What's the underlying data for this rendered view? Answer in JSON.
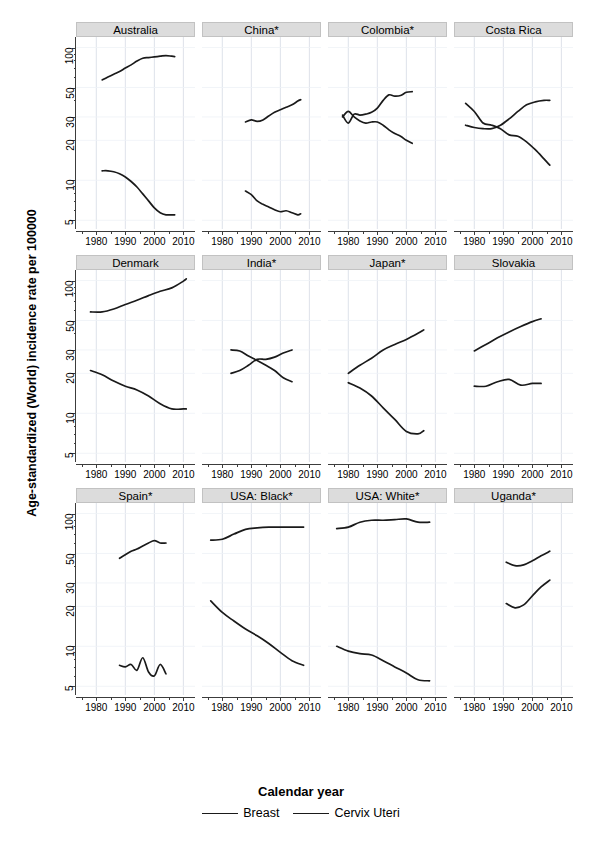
{
  "chart_data": {
    "type": "line",
    "title": "",
    "xlabel": "Calendar year",
    "ylabel": "Age-standardized (World) incidence rate per 100000",
    "yscale": "log",
    "ylim": [
      4.3,
      120
    ],
    "xlim": [
      1973,
      2014
    ],
    "yticks": [
      5,
      10,
      20,
      30,
      50,
      100
    ],
    "ytick_labels": [
      "5",
      "10",
      "20",
      "30",
      "50",
      "100"
    ],
    "xticks": [
      1980,
      1990,
      2000,
      2010
    ],
    "xtick_labels": [
      "1980",
      "1990",
      "2000",
      "2010"
    ],
    "grid": true,
    "legend": {
      "position": "bottom",
      "entries": [
        {
          "name": "Breast",
          "color": "#1a1a1a"
        },
        {
          "name": "Cervix Uteri",
          "color": "#1a1a1a"
        }
      ]
    },
    "layout": {
      "rows": 3,
      "cols": 4
    },
    "panels": [
      {
        "title": "Australia",
        "series": [
          {
            "name": "Breast",
            "x": [
              1982,
              1984,
              1986,
              1988,
              1990,
              1992,
              1994,
              1996,
              1998,
              2000,
              2002,
              2004,
              2006,
              2007
            ],
            "values": [
              57,
              60,
              63,
              66,
              70,
              74,
              79,
              83,
              84,
              85,
              86,
              87,
              86,
              85.5
            ]
          },
          {
            "name": "Cervix Uteri",
            "x": [
              1982,
              1984,
              1986,
              1988,
              1990,
              1992,
              1994,
              1996,
              1998,
              2000,
              2002,
              2004,
              2006,
              2007
            ],
            "values": [
              11.8,
              11.8,
              11.6,
              11.2,
              10.6,
              9.8,
              8.9,
              7.9,
              7.0,
              6.2,
              5.7,
              5.5,
              5.5,
              5.5
            ]
          }
        ]
      },
      {
        "title": "China*",
        "series": [
          {
            "name": "Breast",
            "x": [
              1988,
              1990,
              1992,
              1994,
              1996,
              1998,
              2000,
              2002,
              2004,
              2006,
              2007
            ],
            "values": [
              27.5,
              28.5,
              27.8,
              28.5,
              30.5,
              32.5,
              34,
              35.5,
              37,
              39.5,
              40.5
            ]
          },
          {
            "name": "Cervix Uteri",
            "x": [
              1988,
              1990,
              1992,
              1994,
              1996,
              1998,
              2000,
              2002,
              2004,
              2006,
              2007
            ],
            "values": [
              8.3,
              7.8,
              7.0,
              6.6,
              6.3,
              6.0,
              5.8,
              5.9,
              5.7,
              5.5,
              5.6
            ]
          }
        ]
      },
      {
        "title": "Colombia*",
        "series": [
          {
            "name": "Breast",
            "x": [
              1978,
              1980,
              1982,
              1984,
              1986,
              1988,
              1990,
              1992,
              1994,
              1996,
              1998,
              2000,
              2002
            ],
            "values": [
              31,
              27,
              31.5,
              31,
              31.5,
              32.5,
              35,
              40,
              44,
              43,
              43.5,
              46,
              46.5
            ]
          },
          {
            "name": "Cervix Uteri",
            "x": [
              1978,
              1980,
              1982,
              1984,
              1986,
              1988,
              1990,
              1992,
              1994,
              1996,
              1998,
              2000,
              2002
            ],
            "values": [
              30,
              33,
              30,
              28,
              27,
              27.5,
              27.5,
              26,
              24,
              22.5,
              21.5,
              20,
              19
            ]
          }
        ]
      },
      {
        "title": "Costa Rica",
        "series": [
          {
            "name": "Breast",
            "x": [
              1977,
              1980,
              1983,
              1986,
              1989,
              1992,
              1995,
              1998,
              2001,
              2004,
              2006
            ],
            "values": [
              26,
              25,
              24.5,
              24.5,
              26,
              29,
              33,
              37,
              39,
              40,
              40
            ]
          },
          {
            "name": "Cervix Uteri",
            "x": [
              1977,
              1980,
              1983,
              1986,
              1989,
              1992,
              1995,
              1998,
              2001,
              2004,
              2006
            ],
            "values": [
              38,
              33,
              27,
              26,
              24.5,
              22,
              21.5,
              19.5,
              17,
              14.5,
              13
            ]
          }
        ]
      },
      {
        "title": "Denmark",
        "series": [
          {
            "name": "Breast",
            "x": [
              1978,
              1982,
              1986,
              1990,
              1994,
              1998,
              2002,
              2006,
              2010,
              2011
            ],
            "values": [
              58,
              58,
              61,
              66,
              71,
              77,
              83,
              88,
              99,
              103
            ]
          },
          {
            "name": "Cervix Uteri",
            "x": [
              1978,
              1982,
              1986,
              1990,
              1994,
              1998,
              2002,
              2006,
              2010,
              2011
            ],
            "values": [
              21,
              19.5,
              17.5,
              16,
              15,
              13.5,
              11.8,
              10.8,
              10.8,
              10.8
            ]
          }
        ]
      },
      {
        "title": "India*",
        "series": [
          {
            "name": "Breast",
            "x": [
              1983,
              1986,
              1989,
              1992,
              1995,
              1998,
              2001,
              2004
            ],
            "values": [
              20,
              21,
              23,
              25.5,
              25.5,
              26.5,
              28.5,
              30
            ]
          },
          {
            "name": "Cervix Uteri",
            "x": [
              1983,
              1986,
              1989,
              1992,
              1995,
              1998,
              2001,
              2004
            ],
            "values": [
              30,
              29.5,
              27,
              25,
              23,
              21,
              18.5,
              17.3
            ]
          }
        ]
      },
      {
        "title": "Japan*",
        "series": [
          {
            "name": "Breast",
            "x": [
              1980,
              1984,
              1988,
              1992,
              1996,
              2000,
              2004,
              2006
            ],
            "values": [
              20,
              23,
              26,
              30,
              33,
              36,
              40,
              42.5
            ]
          },
          {
            "name": "Cervix Uteri",
            "x": [
              1980,
              1984,
              1988,
              1992,
              1996,
              2000,
              2004,
              2006
            ],
            "values": [
              17,
              15.5,
              13.5,
              11,
              9,
              7.3,
              7.0,
              7.4
            ]
          }
        ]
      },
      {
        "title": "Slovakia",
        "series": [
          {
            "name": "Breast",
            "x": [
              1980,
              1984,
              1988,
              1992,
              1996,
              2000,
              2003
            ],
            "values": [
              29.5,
              33,
              37,
              41,
              45,
              49,
              51.5
            ]
          },
          {
            "name": "Cervix Uteri",
            "x": [
              1980,
              1984,
              1988,
              1992,
              1996,
              2000,
              2003
            ],
            "values": [
              16,
              16,
              17.3,
              18,
              16.3,
              16.8,
              16.8
            ]
          }
        ]
      },
      {
        "title": "Spain*",
        "series": [
          {
            "name": "Breast",
            "x": [
              1988,
              1990,
              1992,
              1994,
              1996,
              1998,
              2000,
              2002,
              2004
            ],
            "values": [
              46,
              49,
              52,
              54,
              57,
              60,
              62.5,
              60,
              60
            ]
          },
          {
            "name": "Cervix Uteri",
            "x": [
              1988,
              1990,
              1992,
              1994,
              1996,
              1998,
              2000,
              2002,
              2004
            ],
            "values": [
              7.2,
              7.0,
              7.3,
              6.6,
              8.2,
              6.4,
              6.0,
              7.3,
              6.2
            ]
          }
        ]
      },
      {
        "title": "USA: Black*",
        "series": [
          {
            "name": "Breast",
            "x": [
              1976,
              1980,
              1984,
              1988,
              1992,
              1996,
              2000,
              2004,
              2008
            ],
            "values": [
              63,
              64,
              70,
              76,
              78,
              79,
              79,
              79,
              79
            ]
          },
          {
            "name": "Cervix Uteri",
            "x": [
              1976,
              1980,
              1984,
              1988,
              1992,
              1996,
              2000,
              2004,
              2008
            ],
            "values": [
              22,
              18,
              15.5,
              13.5,
              12,
              10.5,
              9,
              7.8,
              7.2
            ]
          }
        ]
      },
      {
        "title": "USA: White*",
        "series": [
          {
            "name": "Breast",
            "x": [
              1976,
              1980,
              1984,
              1988,
              1992,
              1996,
              2000,
              2004,
              2008
            ],
            "values": [
              77,
              79,
              86,
              89,
              89,
              90,
              91,
              86,
              86
            ]
          },
          {
            "name": "Cervix Uteri",
            "x": [
              1976,
              1980,
              1984,
              1988,
              1992,
              1996,
              2000,
              2004,
              2008
            ],
            "values": [
              10,
              9.2,
              8.8,
              8.6,
              7.8,
              7.0,
              6.3,
              5.6,
              5.5
            ]
          }
        ]
      },
      {
        "title": "Uganda*",
        "series": [
          {
            "name": "Breast",
            "x": [
              1991,
              1994,
              1997,
              2000,
              2003,
              2006
            ],
            "values": [
              21,
              19.5,
              20.5,
              24,
              28,
              31.5
            ]
          },
          {
            "name": "Cervix Uteri",
            "x": [
              1991,
              1994,
              1997,
              2000,
              2003,
              2006
            ],
            "values": [
              43,
              40.5,
              41,
              44,
              48,
              52
            ]
          }
        ]
      }
    ]
  }
}
